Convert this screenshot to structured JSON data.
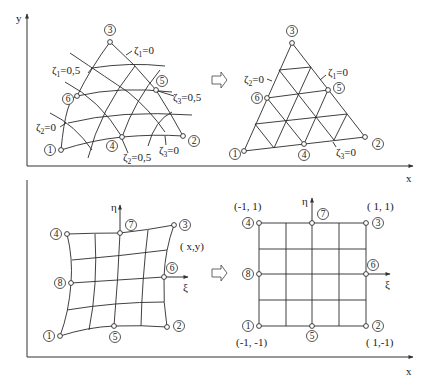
{
  "axes": {
    "top_y_label": "y",
    "top_x_label": "x",
    "bottom_x_label": "x"
  },
  "top_left": {
    "nodes": [
      "1",
      "2",
      "3",
      "4",
      "5",
      "6"
    ],
    "labels": [
      {
        "symbol": "ζ",
        "sub": "1",
        "value": "=0"
      },
      {
        "symbol": "ζ",
        "sub": "1",
        "value": "=0,5"
      },
      {
        "symbol": "ζ",
        "sub": "3",
        "value": "=0,5"
      },
      {
        "symbol": "ζ",
        "sub": "2",
        "value": "=0"
      },
      {
        "symbol": "ζ",
        "sub": "2",
        "value": "=0,5"
      },
      {
        "symbol": "ζ",
        "sub": "3",
        "value": "=0"
      }
    ]
  },
  "top_right": {
    "nodes": [
      "1",
      "2",
      "3",
      "4",
      "5",
      "6"
    ],
    "labels": [
      {
        "symbol": "ζ",
        "sub": "2",
        "value": "=0"
      },
      {
        "symbol": "ζ",
        "sub": "1",
        "value": "=0"
      },
      {
        "symbol": "ζ",
        "sub": "3",
        "value": "=0"
      }
    ]
  },
  "bottom_left": {
    "nodes": [
      "1",
      "2",
      "3",
      "4",
      "5",
      "6",
      "7",
      "8"
    ],
    "axis_eta": "η",
    "axis_xi": "ξ",
    "coord_label": "( x,y)"
  },
  "bottom_right": {
    "nodes": [
      "1",
      "2",
      "3",
      "4",
      "5",
      "6",
      "7",
      "8"
    ],
    "axis_eta": "η",
    "axis_xi": "ξ",
    "corner_coords": {
      "top_left": "(-1, 1)",
      "top_right": "( 1, 1)",
      "bottom_left": "(-1, -1)",
      "bottom_right": "( 1,-1)"
    }
  },
  "transform_arrows": [
    "mapping-arrow-top",
    "mapping-arrow-bottom"
  ]
}
